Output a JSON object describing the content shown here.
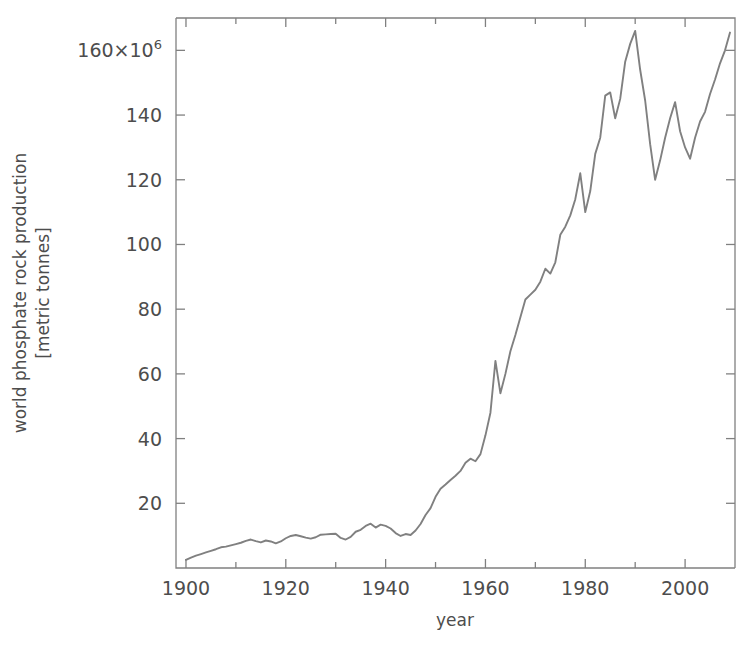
{
  "chart_data": {
    "type": "line",
    "title": "",
    "subtitle": "",
    "xlabel": "year",
    "ylabel": "world phosphate rock production",
    "ylabel_line1": "world phosphate rock production",
    "ylabel_line2": "[metric tonnes]",
    "yunits": "[metric tonnes]",
    "y_scale_factor": "×10",
    "y_scale_exponent": "6",
    "y_top_tick_label": "160",
    "grid": false,
    "legend": null,
    "legend_position": "none",
    "line_color": "#808080",
    "text_color": "#4d4d4d",
    "background_color": "#ffffff",
    "xlim": [
      1898,
      2010
    ],
    "ylim": [
      0,
      170
    ],
    "xticks": [
      1900,
      1920,
      1940,
      1960,
      1980,
      2000
    ],
    "xtick_labels": [
      "1900",
      "1920",
      "1940",
      "1960",
      "1980",
      "2000"
    ],
    "xminor_ticks": [
      1910,
      1930,
      1950,
      1970,
      1990
    ],
    "yticks": [
      20,
      40,
      60,
      80,
      100,
      120,
      140,
      160
    ],
    "ytick_labels": [
      "20",
      "40",
      "60",
      "80",
      "100",
      "120",
      "140",
      "160×10⁶"
    ],
    "series": [
      {
        "name": "world phosphate rock production",
        "x": [
          1900,
          1901,
          1902,
          1903,
          1904,
          1905,
          1906,
          1907,
          1908,
          1909,
          1910,
          1911,
          1912,
          1913,
          1914,
          1915,
          1916,
          1917,
          1918,
          1919,
          1920,
          1921,
          1922,
          1923,
          1924,
          1925,
          1926,
          1927,
          1928,
          1929,
          1930,
          1931,
          1932,
          1933,
          1934,
          1935,
          1936,
          1937,
          1938,
          1939,
          1940,
          1941,
          1942,
          1943,
          1944,
          1945,
          1946,
          1947,
          1948,
          1949,
          1950,
          1951,
          1952,
          1953,
          1954,
          1955,
          1956,
          1957,
          1958,
          1959,
          1960,
          1961,
          1962,
          1963,
          1964,
          1965,
          1966,
          1967,
          1968,
          1969,
          1970,
          1971,
          1972,
          1973,
          1974,
          1975,
          1976,
          1977,
          1978,
          1979,
          1980,
          1981,
          1982,
          1983,
          1984,
          1985,
          1986,
          1987,
          1988,
          1989,
          1990,
          1991,
          1992,
          1993,
          1994,
          1995,
          1996,
          1997,
          1998,
          1999,
          2000,
          2001,
          2002,
          2003,
          2004,
          2005,
          2006,
          2007,
          2008,
          2009
        ],
        "values": [
          2.5,
          3.2,
          3.8,
          4.3,
          4.8,
          5.3,
          5.8,
          6.4,
          6.6,
          7.0,
          7.4,
          7.8,
          8.4,
          8.8,
          8.3,
          7.9,
          8.5,
          8.2,
          7.6,
          8.2,
          9.2,
          9.9,
          10.2,
          9.8,
          9.4,
          9.1,
          9.5,
          10.3,
          10.4,
          10.5,
          10.6,
          9.3,
          8.8,
          9.6,
          11.2,
          11.8,
          13.0,
          13.7,
          12.5,
          13.4,
          13.0,
          12.2,
          10.8,
          9.9,
          10.5,
          10.2,
          11.6,
          13.6,
          16.4,
          18.5,
          22.0,
          24.5,
          25.8,
          27.2,
          28.5,
          30.0,
          32.5,
          33.8,
          33.0,
          35.2,
          41.0,
          48.0,
          64.0,
          54.0,
          60.0,
          67.0,
          72.0,
          77.5,
          83.0,
          84.5,
          86.0,
          88.5,
          92.5,
          91.0,
          94.5,
          103.0,
          105.5,
          109.0,
          114.0,
          122.0,
          110.0,
          116.5,
          128.0,
          133.0,
          146.0,
          147.0,
          139.0,
          145.0,
          156.5,
          162.0,
          166.0,
          154.0,
          144.5,
          131.0,
          120.0,
          126.0,
          133.0,
          139.0,
          144.0,
          135.0,
          130.0,
          126.5,
          133.0,
          138.0,
          141.0,
          146.5,
          151.0,
          156.0,
          160.0,
          165.5
        ]
      }
    ],
    "annotations": [
      {
        "label": "post-war rapid growth",
        "x_start": 1945,
        "x_end": 1988
      },
      {
        "label": "peak production",
        "x": 1990,
        "y": 166.0
      },
      {
        "label": "early 1990s decline",
        "x": 1994,
        "y": 120.0
      }
    ]
  }
}
